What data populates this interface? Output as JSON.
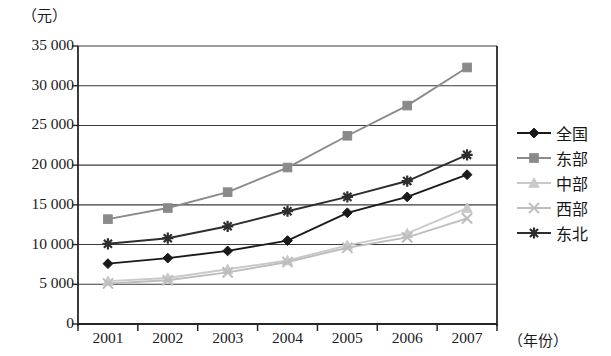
{
  "chart_data": {
    "type": "line",
    "title": "",
    "subtitle": "",
    "ylabel": "（元）",
    "xlabel": "（年份）",
    "categories": [
      "2001",
      "2002",
      "2003",
      "2004",
      "2005",
      "2006",
      "2007"
    ],
    "ytick_labels": [
      "0",
      "5 000",
      "10 000",
      "15 000",
      "20 000",
      "25 000",
      "30 000",
      "35 000"
    ],
    "ytick_values": [
      0,
      5000,
      10000,
      15000,
      20000,
      25000,
      30000,
      35000
    ],
    "ylim": [
      0,
      35000
    ],
    "grid": true,
    "legend_position": "right",
    "series": [
      {
        "name": "全国",
        "color": "#1a1a1a",
        "marker": "diamond",
        "values": [
          7600,
          8300,
          9200,
          10500,
          14000,
          16000,
          18800
        ]
      },
      {
        "name": "东部",
        "color": "#8a8a8a",
        "marker": "square",
        "values": [
          13200,
          14600,
          16600,
          19700,
          23700,
          27500,
          32300
        ]
      },
      {
        "name": "中部",
        "color": "#c9c9c9",
        "marker": "triangle",
        "values": [
          5400,
          5800,
          6900,
          8000,
          9900,
          11400,
          14600
        ]
      },
      {
        "name": "西部",
        "color": "#bdbdbd",
        "marker": "cross",
        "values": [
          5100,
          5500,
          6500,
          7800,
          9600,
          10900,
          13300
        ]
      },
      {
        "name": "东北",
        "color": "#2e2e2e",
        "marker": "asterisk",
        "values": [
          10100,
          10800,
          12300,
          14200,
          16000,
          18000,
          21300
        ]
      }
    ]
  },
  "legend": {
    "items": [
      {
        "label": "全国"
      },
      {
        "label": "东部"
      },
      {
        "label": "中部"
      },
      {
        "label": "西部"
      },
      {
        "label": "东北"
      }
    ]
  }
}
